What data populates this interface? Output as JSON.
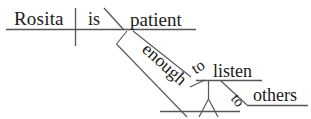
{
  "diagram": {
    "type": "reed-kellogg-sentence-diagram",
    "sentence": "Rosita is patient enough to listen to others.",
    "ink_color": "#1a1a1a",
    "line_color": "#555555",
    "background_color": "#ffffff",
    "words": {
      "subject": "Rosita",
      "verb": "is",
      "predicate_adjective": "patient",
      "adverb": "enough",
      "infinitive_marker_1": "to",
      "infinitive_verb": "listen",
      "preposition": "to",
      "object_of_preposition": "others"
    },
    "labels": [
      {
        "id": "subject",
        "text": "Rosita"
      },
      {
        "id": "verb",
        "text": "is"
      },
      {
        "id": "predicate-adjective",
        "text": "patient"
      },
      {
        "id": "adverb",
        "text": "enough"
      },
      {
        "id": "infinitive-to",
        "text": "to"
      },
      {
        "id": "infinitive-verb",
        "text": "listen"
      },
      {
        "id": "preposition-to",
        "text": "to"
      },
      {
        "id": "prepositional-object",
        "text": "others"
      }
    ]
  }
}
